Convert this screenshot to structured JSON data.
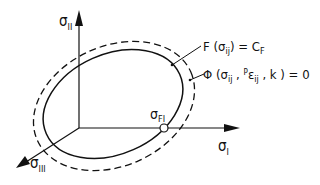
{
  "diagram": {
    "axes": {
      "sigma_1": {
        "base": "σ",
        "sub": "I"
      },
      "sigma_2": {
        "base": "σ",
        "sub": "II"
      },
      "sigma_3": {
        "base": "σ",
        "sub": "III"
      }
    },
    "point": {
      "base": "σ",
      "sub": "FI"
    },
    "yield_surface_label": {
      "prefix": "F (σ",
      "sub1": "ij",
      "middle": ") = C",
      "sub2": "F"
    },
    "loading_surface_label": {
      "prefix": "Φ (σ",
      "sub1": "ij",
      "middle1": " , ",
      "sup": "P",
      "eps": "ε",
      "sub2": "ij",
      "middle2": " , k ) = 0"
    },
    "colors": {
      "line": "#111111",
      "background": "#ffffff"
    }
  }
}
